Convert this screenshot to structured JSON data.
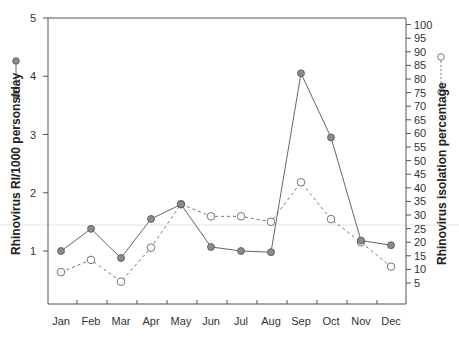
{
  "chart_data": {
    "type": "line",
    "title": "",
    "xlabel": "",
    "categories": [
      "Jan",
      "Feb",
      "Mar",
      "Apr",
      "May",
      "Jun",
      "Jul",
      "Aug",
      "Sep",
      "Oct",
      "Nov",
      "Dec"
    ],
    "series": [
      {
        "name": "Rhinovirus RI/1000 persons/day",
        "axis": "left",
        "style": "solid line, filled gray circles",
        "values": [
          1.0,
          1.38,
          0.88,
          1.55,
          1.8,
          1.07,
          1.0,
          0.98,
          4.05,
          2.95,
          1.18,
          1.1
        ]
      },
      {
        "name": "Rhinovirus isolation percentage",
        "axis": "right",
        "style": "dashed line, open circles",
        "values": [
          9,
          13.5,
          5.5,
          18,
          34,
          29.5,
          29.5,
          27.5,
          42,
          28.5,
          20,
          11
        ]
      }
    ],
    "ylabel_left": "Rhinovirus RI/1000 persons/day",
    "ylabel_right": "Rhinovirus isolation percentage",
    "ylim_left": [
      0,
      5
    ],
    "ylim_right": [
      0,
      100
    ],
    "yticks_left": [
      1,
      2,
      3,
      4,
      5
    ],
    "yticks_right": [
      5,
      10,
      15,
      20,
      25,
      30,
      35,
      40,
      45,
      50,
      55,
      60,
      65,
      70,
      75,
      80,
      85,
      90,
      95,
      100
    ],
    "grid": false,
    "legend_position": "beside axis titles (left and right)"
  },
  "colors": {
    "axis": "#555555",
    "line": "#666666",
    "filled_marker": "#8a8a8a",
    "open_marker": "#ffffff"
  }
}
